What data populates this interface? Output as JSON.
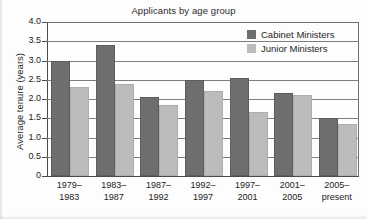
{
  "chart_data": {
    "type": "bar",
    "title": "Applicants by age group",
    "xlabel": "",
    "ylabel": "Average tenure (years)",
    "categories": [
      "1979–\n1983",
      "1983–\n1987",
      "1987–\n1992",
      "1992–\n1997",
      "1997–\n2001",
      "2001–\n2005",
      "2005–\npresent"
    ],
    "category_lines": [
      [
        "1979–",
        "1983"
      ],
      [
        "1983–",
        "1987"
      ],
      [
        "1987–",
        "1992"
      ],
      [
        "1992–",
        "1997"
      ],
      [
        "1997–",
        "2001"
      ],
      [
        "2001–",
        "2005"
      ],
      [
        "2005–",
        "present"
      ]
    ],
    "series": [
      {
        "name": "Cabinet Ministers",
        "color": "#6e6e6e",
        "values": [
          3.0,
          3.4,
          2.05,
          2.5,
          2.55,
          2.15,
          1.5
        ]
      },
      {
        "name": "Junior Ministers",
        "color": "#bcbcbc",
        "values": [
          2.3,
          2.4,
          1.85,
          2.2,
          1.65,
          2.1,
          1.35
        ]
      }
    ],
    "ylim": [
      0,
      4.0
    ],
    "yticks": [
      0,
      0.5,
      1.0,
      1.5,
      2.0,
      2.5,
      3.0,
      3.5,
      4.0
    ],
    "ytick_labels": [
      "0",
      "0.5",
      "1.0",
      "1.5",
      "2.0",
      "2.5",
      "3.0",
      "3.5",
      "4.0"
    ],
    "grid": "horizontal",
    "legend_position": "top-right"
  },
  "legend": {
    "entries": [
      {
        "label": "Cabinet Ministers",
        "color": "#6e6e6e"
      },
      {
        "label": "Junior Ministers",
        "color": "#bcbcbc"
      }
    ]
  }
}
